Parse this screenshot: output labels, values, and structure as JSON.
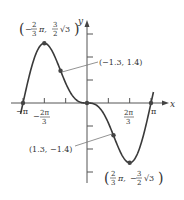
{
  "chart_data": {
    "type": "line",
    "title": "",
    "function": "y = -2 sin x + sin 2x",
    "xlabel": "x",
    "ylabel": "y",
    "xlim": [
      -3.14159,
      3.14159
    ],
    "ylim": [
      -3.5,
      3.5
    ],
    "grid": false,
    "x_ticks": [
      {
        "value": -3.14159,
        "label": "−π"
      },
      {
        "value": -2.0944,
        "label": "−2π/3"
      },
      {
        "value": -1.0472,
        "label": ""
      },
      {
        "value": 1.0472,
        "label": ""
      },
      {
        "value": 2.0944,
        "label": "2π/3"
      },
      {
        "value": 3.14159,
        "label": "π"
      }
    ],
    "y_ticks": [
      -3,
      -2,
      -1,
      1,
      2,
      3
    ],
    "points": [
      {
        "x": -3.14159,
        "y": 0,
        "label": ""
      },
      {
        "x": -2.0944,
        "y": 2.598,
        "label": "(−2/3 π, 3/2 √3)",
        "kind": "maximum"
      },
      {
        "x": -1.3,
        "y": 1.4,
        "label": "(−1.3, 1.4)",
        "kind": "inflection"
      },
      {
        "x": 0,
        "y": 0,
        "label": "",
        "kind": "inflection"
      },
      {
        "x": 1.3,
        "y": -1.4,
        "label": "(1.3, −1.4)",
        "kind": "inflection"
      },
      {
        "x": 2.0944,
        "y": -2.598,
        "label": "(2/3 π, −3/2 √3)",
        "kind": "minimum"
      },
      {
        "x": 3.14159,
        "y": 0,
        "label": ""
      }
    ],
    "series": [
      {
        "name": "f(x)",
        "color": "#3a3a3a"
      }
    ]
  },
  "labels": {
    "x_axis": "x",
    "y_axis": "y",
    "neg_pi": "−π",
    "pi": "π",
    "neg_two_pi_three_num": "2π",
    "neg_two_pi_three_den": "3",
    "neg_sign": "−",
    "two_pi_three_num": "2π",
    "two_pi_three_den": "3",
    "inflection_left": "(−1.3, 1.4)",
    "inflection_right": "(1.3, −1.4)",
    "max_label": {
      "open": "(",
      "sign": "−",
      "frac1_num": "2",
      "frac1_den": "3",
      "pi": "π,",
      "frac2_num": "3",
      "frac2_den": "2",
      "root": "√3",
      "close": ")"
    },
    "min_label": {
      "open": "(",
      "frac1_num": "2",
      "frac1_den": "3",
      "pi": "π,",
      "sign": "−",
      "frac2_num": "3",
      "frac2_den": "2",
      "root": "√3",
      "close": ")"
    }
  },
  "colors": {
    "curve": "#3a3a3a",
    "axis": "#555555",
    "leader": "#777777",
    "text": "#333333"
  }
}
